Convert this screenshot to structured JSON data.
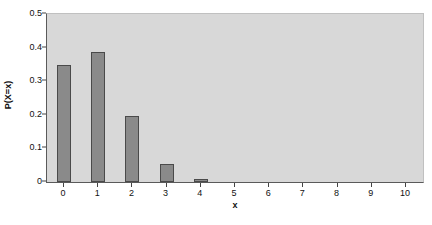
{
  "chart_data": {
    "type": "bar",
    "title": "",
    "subtitle": "",
    "xlabel": "x",
    "ylabel": "P(X=x)",
    "categories": [
      "0",
      "1",
      "2",
      "3",
      "4",
      "5",
      "6",
      "7",
      "8",
      "9",
      "10"
    ],
    "values": [
      0.348,
      0.387,
      0.195,
      0.055,
      0.008,
      0.0,
      0.0,
      0.0,
      0.0,
      0.0,
      0.0
    ],
    "series": [
      {
        "name": "P(X=x)",
        "values": [
          0.348,
          0.387,
          0.195,
          0.055,
          0.008,
          0.0,
          0.0,
          0.0,
          0.0,
          0.0,
          0.0
        ]
      }
    ],
    "xlim": [
      -0.5,
      10.5
    ],
    "ylim": [
      0,
      0.5
    ],
    "ytick_labels": [
      "0",
      "0.1",
      "0.2",
      "0.3",
      "0.4",
      "0.5"
    ],
    "ytick_values": [
      0,
      0.1,
      0.2,
      0.3,
      0.4,
      0.5
    ],
    "xtick_labels": [
      "0",
      "1",
      "2",
      "3",
      "4",
      "5",
      "6",
      "7",
      "8",
      "9",
      "10"
    ],
    "xtick_values": [
      0,
      1,
      2,
      3,
      4,
      5,
      6,
      7,
      8,
      9,
      10
    ],
    "grid": false,
    "legend": false,
    "legend_position": "none",
    "colors": {
      "bar_fill": "#8a8a8a",
      "bar_edge": "#4a4a4a",
      "plot_background": "#d8d8d8",
      "figure_background": "#ffffff",
      "axis": "#5a5a5a",
      "text": "#111111"
    }
  }
}
